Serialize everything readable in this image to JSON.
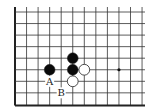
{
  "diagram": {
    "type": "go-board-fragment",
    "grid": {
      "x0": 15,
      "y0": 12,
      "spacing": 11.55,
      "cols": 12,
      "rows": 9,
      "right_extent": 145,
      "top_extent": 7,
      "left_edge": true,
      "bottom_edge": true,
      "line_color": "#333333",
      "edge_color": "#222222"
    },
    "stones": [
      {
        "color": "black",
        "col": 3,
        "row": 5
      },
      {
        "color": "black",
        "col": 5,
        "row": 4
      },
      {
        "color": "black",
        "col": 5,
        "row": 5
      },
      {
        "color": "white",
        "col": 6,
        "row": 5
      },
      {
        "color": "white",
        "col": 5,
        "row": 6
      }
    ],
    "star_points": [
      {
        "col": 9,
        "row": 5
      }
    ],
    "labels": [
      {
        "text": "A",
        "col": 3,
        "row": 6
      },
      {
        "text": "B",
        "col": 4,
        "row": 7
      }
    ]
  }
}
